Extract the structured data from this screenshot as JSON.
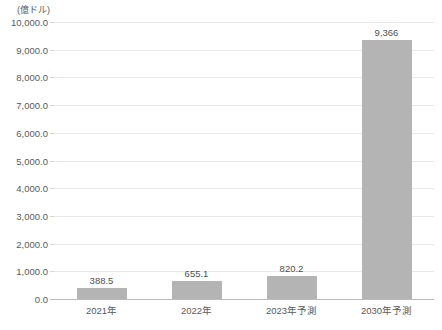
{
  "chart_data": {
    "type": "bar",
    "title": "",
    "subtitle": "",
    "unit_label": "(億ドル)",
    "xlabel": "",
    "ylabel": "",
    "categories": [
      "2021年",
      "2022年",
      "2023年予測",
      "2030年予測"
    ],
    "values": [
      388.5,
      655.1,
      820.2,
      9366
    ],
    "value_labels": [
      "388.5",
      "655.1",
      "820.2",
      "9,366"
    ],
    "ylim": [
      0,
      10000
    ],
    "ytick_step": 1000,
    "ytick_labels": [
      "10,000.0",
      "9,000.0",
      "8,000.0",
      "7,000.0",
      "6,000.0",
      "5,000.0",
      "4,000.0",
      "3,000.0",
      "2,000.0",
      "1,000.0",
      "0.0"
    ],
    "ytick_values": [
      10000,
      9000,
      8000,
      7000,
      6000,
      5000,
      4000,
      3000,
      2000,
      1000,
      0
    ],
    "grid": true,
    "grid_axis": "y",
    "legend": false,
    "legend_position": "none",
    "series": [
      {
        "name": "",
        "values": [
          388.5,
          655.1,
          820.2,
          9366
        ]
      }
    ],
    "colors": {
      "bar_fill": "#b4b4b4",
      "gridline": "#e9e9e9",
      "axis_line": "#bdbdbd",
      "text": "#5a5a5a",
      "background": "#ffffff"
    }
  }
}
